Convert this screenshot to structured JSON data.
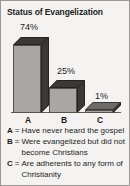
{
  "panel": {
    "title": "Status of Evangelization",
    "background_color": "#f4f3f1",
    "border_color": "#9a9894",
    "text_color": "#1c1c1c"
  },
  "chart_data": {
    "type": "bar",
    "title": "Status of Evangelization",
    "categories": [
      "A",
      "B",
      "C"
    ],
    "values": [
      74,
      25,
      1
    ],
    "value_labels": [
      "74%",
      "25%",
      "1%"
    ],
    "xlabel": "",
    "ylabel": "",
    "ylim": [
      0,
      100
    ],
    "grid": false,
    "legend_position": "below",
    "style": "3d-bar",
    "bar_face_color": "#a9a7a3",
    "bar_shade_color": "#3a3937",
    "axis_color": "#5e5c59",
    "series": [
      {
        "name": "Status of Evangelization",
        "values": [
          74,
          25,
          1
        ]
      }
    ],
    "annotations": [
      {
        "key": "A",
        "label": "Have never heard the gospel",
        "value": 74
      },
      {
        "key": "B",
        "label": "Were evangelized but did not become Christians",
        "value": 25
      },
      {
        "key": "C",
        "label": "Are adherents to any form of Christianity",
        "value": 1
      }
    ]
  },
  "legend": {
    "separator": "=",
    "items": [
      {
        "key": "A",
        "text": "Have never heard the gospel"
      },
      {
        "key": "B",
        "text": "Were evangelized but did not become Christians"
      },
      {
        "key": "C",
        "text": "Are adherents to any form of Christianity"
      }
    ]
  }
}
